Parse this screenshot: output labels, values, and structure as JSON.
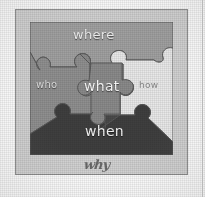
{
  "figure": {
    "frame": {
      "outer_color": "#d2d2d2",
      "outer_border_color": "#8e8e8e",
      "inner_border_color": "#6d6d6d",
      "background_color": "#fdfdfd"
    },
    "quadrants": [
      {
        "name": "top",
        "color": "#a8a8a8"
      },
      {
        "name": "left",
        "color": "#9a9a9a"
      },
      {
        "name": "right",
        "color": "#ededed"
      },
      {
        "name": "bottom",
        "color": "#4a4a4a"
      }
    ],
    "pieces": [
      {
        "id": "top",
        "label": "where",
        "fill": "#a0a0a0",
        "text_color": "#f2f2f2"
      },
      {
        "id": "left",
        "label": "who",
        "fill": "#8f8f8f",
        "text_color": "#e2e2e2"
      },
      {
        "id": "center",
        "label": "what",
        "fill": "#8a8a8a",
        "text_color": "#fbfbfb"
      },
      {
        "id": "right",
        "label": "how",
        "fill": "#e8e8e8",
        "text_color": "#8a8a8a"
      },
      {
        "id": "bottom",
        "label": "when",
        "fill": "#3f3f3f",
        "text_color": "#f6f6f6"
      }
    ],
    "caption": {
      "label": "why",
      "style": "handwritten-script",
      "color": "#6a6a6a"
    }
  }
}
